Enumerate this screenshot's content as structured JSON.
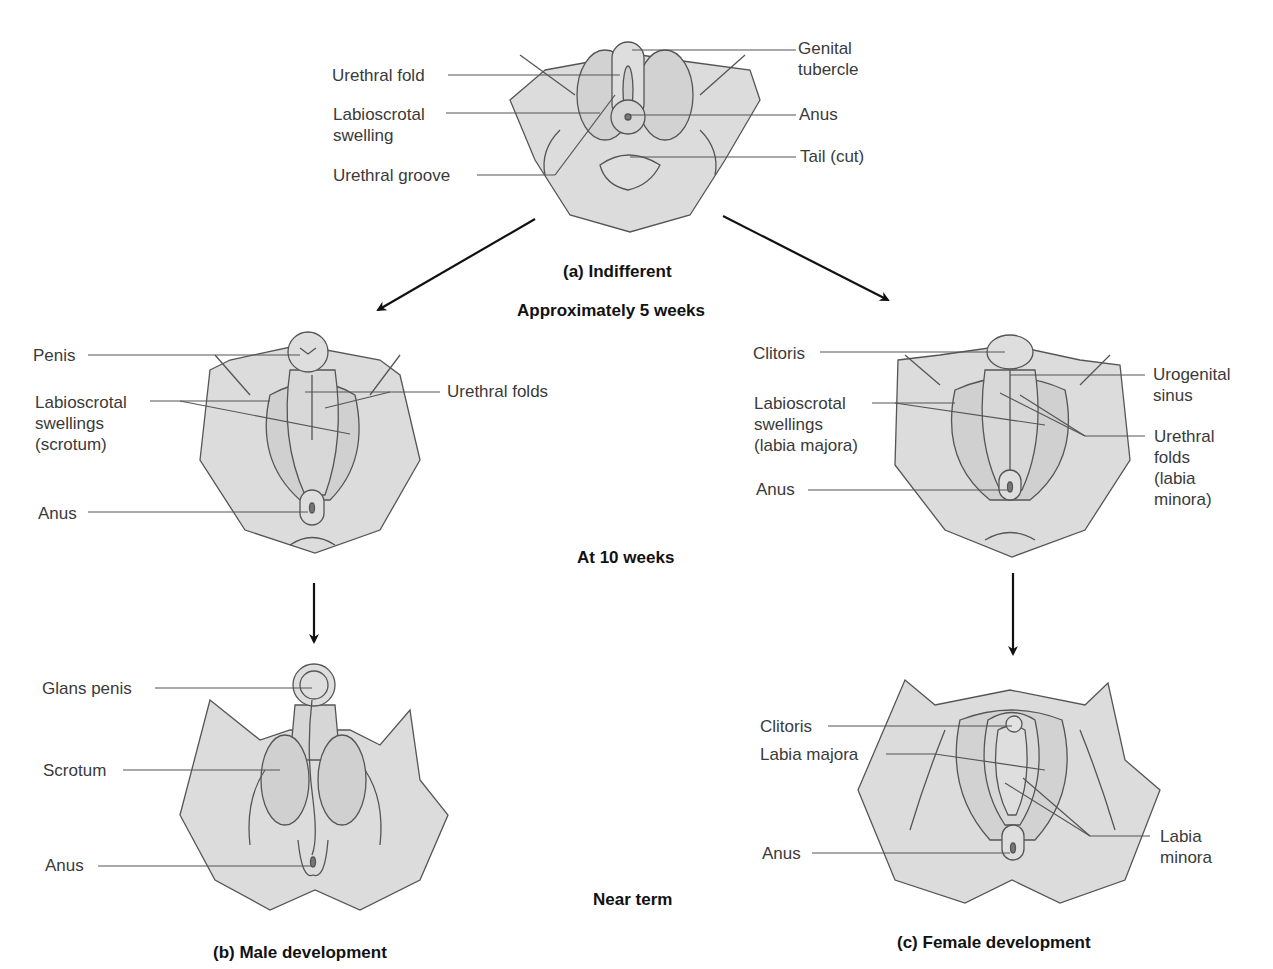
{
  "colors": {
    "skin": "#dcdcdc",
    "shade": "#cacaca",
    "line": "#555555",
    "arrow": "#111111"
  },
  "panels": {
    "indifferent": {
      "caption": "(a) Indifferent",
      "age": "Approximately 5 weeks",
      "labels": {
        "genital_tubercle": "Genital\ntubercle",
        "urethral_fold": "Urethral fold",
        "labioscrotal_swelling": "Labioscrotal\nswelling",
        "anus": "Anus",
        "urethral_groove": "Urethral groove",
        "tail": "Tail (cut)"
      }
    },
    "stage_10_weeks": {
      "age": "At 10 weeks"
    },
    "male_10wk": {
      "labels": {
        "penis": "Penis",
        "labioscrotal": "Labioscrotal\nswellings\n(scrotum)",
        "urethral_folds": "Urethral folds",
        "anus": "Anus"
      }
    },
    "female_10wk": {
      "labels": {
        "clitoris": "Clitoris",
        "labioscrotal": "Labioscrotal\nswellings\n(labia majora)",
        "anus": "Anus",
        "urogenital_sinus": "Urogenital\nsinus",
        "urethral_folds": "Urethral\nfolds\n(labia\nminora)"
      }
    },
    "near_term": {
      "age": "Near term"
    },
    "male_term": {
      "caption": "(b) Male development",
      "labels": {
        "glans_penis": "Glans penis",
        "scrotum": "Scrotum",
        "anus": "Anus"
      }
    },
    "female_term": {
      "caption": "(c) Female development",
      "labels": {
        "clitoris": "Clitoris",
        "labia_majora": "Labia majora",
        "anus": "Anus",
        "labia_minora": "Labia\nminora"
      }
    }
  }
}
